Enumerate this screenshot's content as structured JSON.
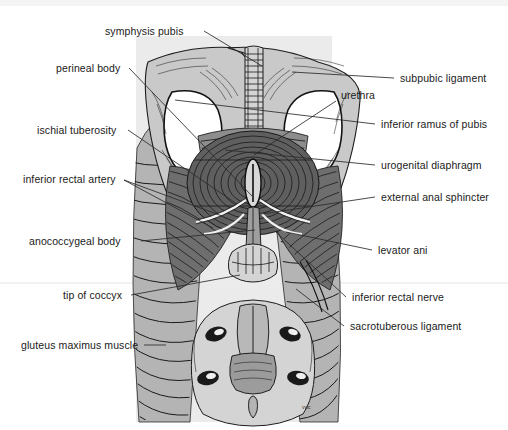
{
  "figure": {
    "signature": "vwc",
    "palette": {
      "background": "#ffffff",
      "panel_gray": "#d9d9d9",
      "bone_gray": "#c9c9c9",
      "muscle_dark": "#6e6e6e",
      "muscle_mid": "#8d8d8d",
      "muscle_light": "#b4b4b4",
      "ink": "#1a1a1a",
      "leader": "#2b2b2b"
    }
  },
  "labels": {
    "left": [
      {
        "id": "symphysis-pubis",
        "text": "symphysis pubis",
        "x": 105,
        "y": 25,
        "tx": 202,
        "ty": 31,
        "ex": 262,
        "ey": 66
      },
      {
        "id": "perineal-body",
        "text": "perineal body",
        "x": 56,
        "y": 62,
        "tx": 127,
        "ty": 68,
        "ex": 252,
        "ey": 196
      },
      {
        "id": "ischial-tuberosity",
        "text": "ischial tuberosity",
        "x": 37,
        "y": 124,
        "tx": 126,
        "ty": 130,
        "ex": 237,
        "ey": 204
      },
      {
        "id": "inferior-rectal-artery",
        "text": "inferior rectal artery",
        "x": 23,
        "y": 173,
        "tx": 122,
        "ty": 180,
        "ex": 213,
        "ey": 228
      },
      {
        "id": "anococcygeal-body",
        "text": "anococcygeal body",
        "x": 29,
        "y": 235,
        "tx": 139,
        "ty": 241,
        "ex": 255,
        "ey": 230
      },
      {
        "id": "tip-of-coccyx",
        "text": "tip of coccyx",
        "x": 63,
        "y": 289,
        "tx": 129,
        "ty": 295,
        "ex": 240,
        "ey": 275
      },
      {
        "id": "gluteus-maximus-muscle",
        "text": "gluteus maximus muscle",
        "x": 21,
        "y": 339,
        "tx": 142,
        "ty": 345,
        "ex": 165,
        "ey": 345
      }
    ],
    "right": [
      {
        "id": "subpubic-ligament",
        "text": "subpubic ligament",
        "x": 400,
        "y": 72,
        "tx": 396,
        "ty": 78,
        "ex": 292,
        "ey": 72
      },
      {
        "id": "urethra",
        "text": "urethra",
        "x": 341,
        "y": 89,
        "tx": 338,
        "ty": 101,
        "ex": 254,
        "ey": 155
      },
      {
        "id": "inferior-ramus-of-pubis",
        "text": "inferior ramus of pubis",
        "x": 381,
        "y": 118,
        "tx": 377,
        "ty": 124,
        "ex": 175,
        "ey": 100
      },
      {
        "id": "urogenital-diaphragm",
        "text": "urogenital diaphragm",
        "x": 381,
        "y": 159,
        "tx": 377,
        "ty": 165,
        "ex": 225,
        "ey": 150
      },
      {
        "id": "external-anal-sphincter",
        "text": "external anal sphincter",
        "x": 381,
        "y": 191,
        "tx": 377,
        "ty": 197,
        "ex": 262,
        "ey": 214
      },
      {
        "id": "levator-ani",
        "text": "levator ani",
        "x": 378,
        "y": 244,
        "tx": 374,
        "ty": 250,
        "ex": 286,
        "ey": 232
      },
      {
        "id": "inferior-rectal-nerve",
        "text": "inferior rectal nerve",
        "x": 352,
        "y": 291,
        "tx": 348,
        "ty": 297,
        "ex": 276,
        "ey": 232
      },
      {
        "id": "sacrotuberous-ligament",
        "text": "sacrotuberous ligament",
        "x": 350,
        "y": 320,
        "tx": 346,
        "ty": 326,
        "ex": 296,
        "ey": 289
      }
    ]
  }
}
